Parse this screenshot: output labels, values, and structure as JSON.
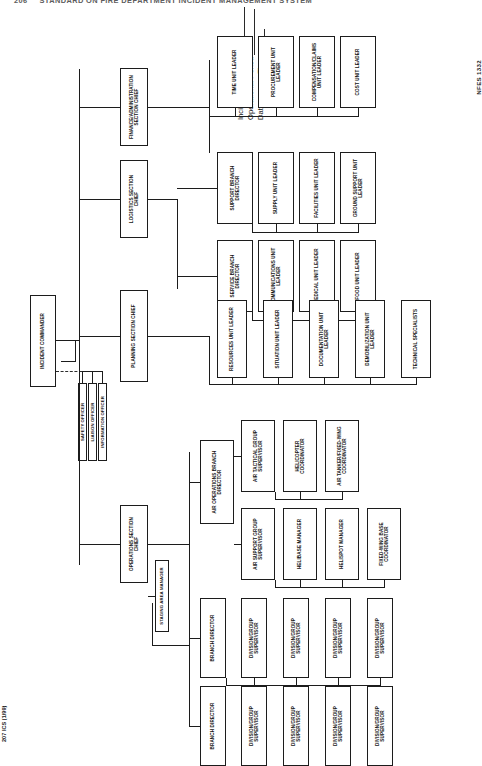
{
  "page": {
    "running_head_number": "206",
    "running_head_title": "STANDARD ON FIRE DEPARTMENT INCIDENT MANAGEMENT SYSTEM",
    "form_number": "207 ICS (1/99)",
    "nfes_number": "NFES 1332"
  },
  "form_fields": [
    {
      "label": "Incident Name"
    },
    {
      "label": "Operational Period"
    },
    {
      "label": "Date",
      "label2": "Time"
    }
  ],
  "chart": {
    "command": {
      "incident_commander": "INCIDENT COMMANDER",
      "command_staff": [
        "SAFETY OFFICER",
        "LIAISON OFFICER",
        "INFORMATION OFFICER"
      ]
    },
    "sections": [
      {
        "id": "finance",
        "label": "FINANCE/ADMINISTRATION\nSECTION CHIEF"
      },
      {
        "id": "logistics",
        "label": "LOGISTICS SECTION\nCHIEF"
      },
      {
        "id": "planning",
        "label": "PLANNING SECTION CHIEF"
      },
      {
        "id": "operations",
        "label": "OPERATIONS SECTION\nCHIEF"
      }
    ],
    "finance_units": [
      "TIME UNIT LEADER",
      "PROCUREMENT UNIT\nLEADER",
      "COMPENSATION/CLAIMS\nUNIT LEADER",
      "COST UNIT LEADER"
    ],
    "logistics_branches": [
      {
        "label": "SERVICE BRANCH\nDIRECTOR",
        "units": [
          "COMMUNICATIONS UNIT\nLEADER",
          "MEDICAL UNIT LEADER",
          "FOOD UNIT LEADER"
        ]
      },
      {
        "label": "SUPPORT BRANCH\nDIRECTOR",
        "units": [
          "SUPPLY UNIT LEADER",
          "FACILITIES UNIT LEADER",
          "GROUND SUPPORT UNIT\nLEADER"
        ]
      }
    ],
    "planning_units": [
      "RESOURCES UNIT LEADER",
      "SITUATION UNIT LEADER",
      "DOCUMENTATION UNIT\nLEADER",
      "DEMOBILIZATION UNIT\nLEADER",
      "TECHNICAL SPECIALISTS"
    ],
    "operations": {
      "staging_area_manager": "STAGING AREA MANAGER",
      "air_operations_branch_director": "AIR OPERATIONS BRANCH\nDIRECTOR",
      "air_groups": [
        {
          "label": "AIR TACTICAL GROUP\nSUPERVISOR",
          "units": [
            "HELICOPTER\nCOORDINATOR",
            "AIR TANKER/FIXED-WING\nCOORDINATOR"
          ]
        },
        {
          "label": "AIR SUPPORT GROUP\nSUPERVISOR",
          "units": [
            "HELIBASE MANAGER",
            "HELISPOT MANAGER",
            "FIXED-WING BASE\nCOORDINATOR"
          ]
        }
      ],
      "branches": [
        {
          "label": "BRANCH DIRECTOR",
          "divisions": [
            "DIVISION/GROUP\nSUPERVISOR",
            "DIVISION/GROUP\nSUPERVISOR",
            "DIVISION/GROUP\nSUPERVISOR",
            "DIVISION/GROUP\nSUPERVISOR"
          ]
        },
        {
          "label": "BRANCH DIRECTOR",
          "divisions": [
            "DIVISION/GROUP\nSUPERVISOR",
            "DIVISION/GROUP\nSUPERVISOR",
            "DIVISION/GROUP\nSUPERVISOR",
            "DIVISION/GROUP\nSUPERVISOR"
          ]
        }
      ]
    }
  }
}
